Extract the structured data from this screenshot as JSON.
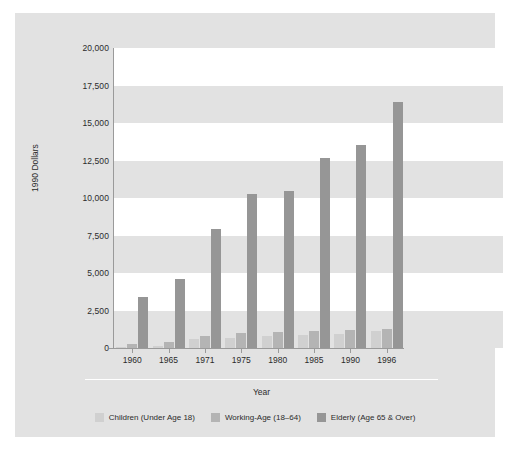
{
  "chart_data": {
    "type": "bar",
    "title": "",
    "xlabel": "Year",
    "ylabel": "1990 Dollars",
    "categories": [
      "1960",
      "1965",
      "1971",
      "1975",
      "1980",
      "1985",
      "1990",
      "1996"
    ],
    "ylim": [
      0,
      20000
    ],
    "ytick_labels": [
      "0",
      "2,500",
      "5,000",
      "7,500",
      "10,000",
      "12,500",
      "15,000",
      "17,500",
      "20,000"
    ],
    "ytick_values": [
      0,
      2500,
      5000,
      7500,
      10000,
      12500,
      15000,
      17500,
      20000
    ],
    "grid": "horizontal-alternating-bands",
    "legend_position": "bottom-center",
    "series": [
      {
        "name": "Children (Under Age 18)",
        "color": "#d0d0d0",
        "values": [
          100,
          150,
          600,
          700,
          800,
          850,
          950,
          1150
        ]
      },
      {
        "name": "Working-Age (18–64)",
        "color": "#b4b4b4",
        "values": [
          250,
          400,
          800,
          1000,
          1100,
          1150,
          1200,
          1300
        ]
      },
      {
        "name": "Elderly (Age 65 & Over)",
        "color": "#969696",
        "values": [
          3400,
          4600,
          7950,
          10250,
          10500,
          12700,
          13550,
          16400
        ]
      }
    ]
  },
  "legend": {
    "items": [
      {
        "label": "Children (Under Age 18)"
      },
      {
        "label": "Working-Age (18–64)"
      },
      {
        "label": "Elderly (Age 65 & Over)"
      }
    ]
  }
}
